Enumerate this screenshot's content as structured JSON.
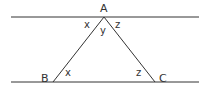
{
  "diagram": {
    "type": "parallel-lines-triangle",
    "line_color": "#333333",
    "vertices": {
      "A": {
        "label": "A",
        "x": 104,
        "y": 17
      },
      "B": {
        "label": "B",
        "x": 53,
        "y": 82
      },
      "C": {
        "label": "C",
        "x": 155,
        "y": 82
      }
    },
    "angles": {
      "top_left": "x",
      "top_middle": "y",
      "top_right": "z",
      "at_B": "x",
      "at_C": "z"
    }
  }
}
